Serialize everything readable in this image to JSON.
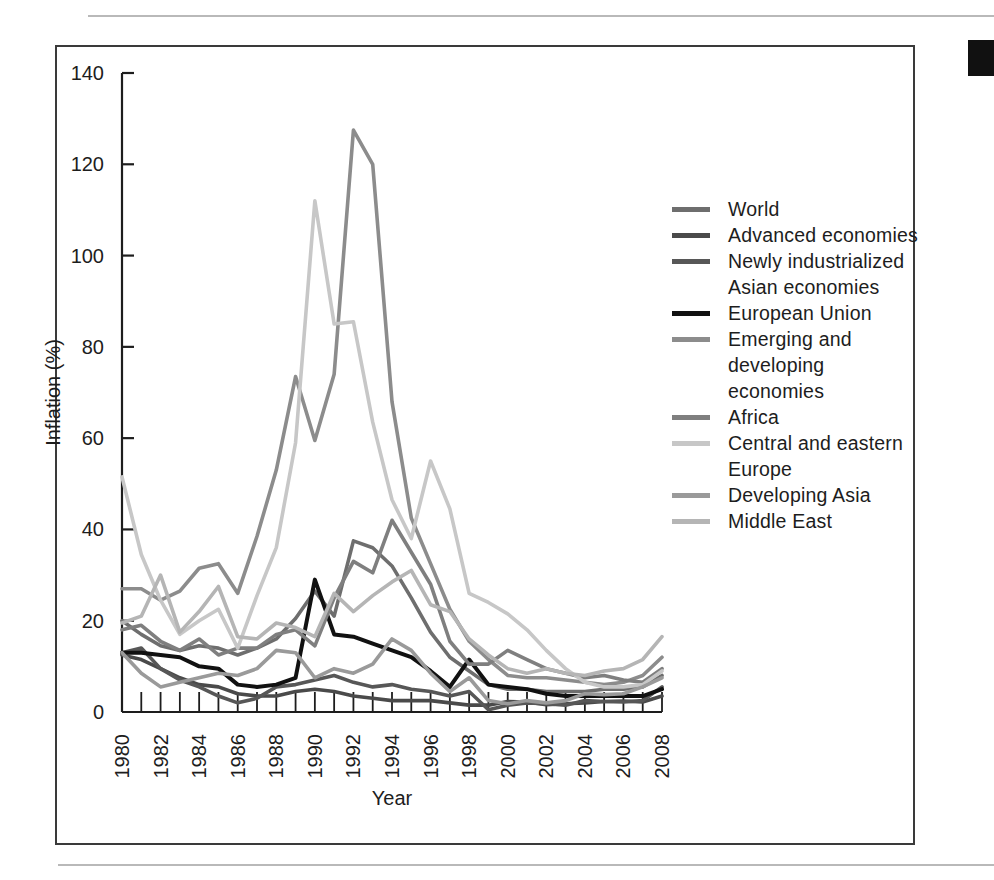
{
  "figure": {
    "frame_color": "#3a3a3a",
    "background": "#ffffff",
    "edge_mark_color": "#111111"
  },
  "chart_data": {
    "type": "line",
    "title": "",
    "xlabel": "Year",
    "ylabel": "Inflation (%)",
    "xlim": [
      1980,
      2008
    ],
    "ylim": [
      0,
      140
    ],
    "ytick_values": [
      0,
      20,
      40,
      60,
      80,
      100,
      120,
      140
    ],
    "xtick_values": [
      1980,
      1982,
      1984,
      1986,
      1988,
      1990,
      1992,
      1994,
      1996,
      1998,
      2000,
      2002,
      2004,
      2006,
      2008
    ],
    "xtick_labels": [
      "1980",
      "1982",
      "1984",
      "1986",
      "1988",
      "1990",
      "1992",
      "1994",
      "1996",
      "1998",
      "2000",
      "2002",
      "2004",
      "2006",
      "2008"
    ],
    "minor_xticks_every": 1,
    "grid": false,
    "legend_position": "right",
    "x": [
      1980,
      1981,
      1982,
      1983,
      1984,
      1985,
      1986,
      1987,
      1988,
      1989,
      1990,
      1991,
      1992,
      1993,
      1994,
      1995,
      1996,
      1997,
      1998,
      1999,
      2000,
      2001,
      2002,
      2003,
      2004,
      2005,
      2006,
      2007,
      2008
    ],
    "series": [
      {
        "name": "World",
        "color": "#6e6e6e",
        "width": 3.6,
        "values": [
          20.0,
          17.0,
          14.5,
          13.5,
          14.5,
          14.0,
          12.5,
          14.0,
          16.0,
          20.5,
          26.5,
          21.0,
          37.5,
          36.0,
          32.0,
          25.0,
          17.5,
          12.0,
          9.0,
          6.0,
          5.0,
          5.0,
          4.5,
          4.5,
          4.5,
          5.0,
          5.0,
          5.5,
          8.0
        ]
      },
      {
        "name": "Advanced economies",
        "color": "#4a4a4a",
        "width": 3.6,
        "values": [
          12.5,
          11.5,
          9.5,
          7.5,
          6.0,
          5.5,
          4.0,
          3.5,
          3.5,
          4.5,
          5.0,
          4.5,
          3.5,
          3.0,
          2.5,
          2.5,
          2.5,
          2.0,
          1.5,
          1.5,
          2.3,
          2.2,
          1.6,
          1.8,
          2.0,
          2.3,
          2.4,
          2.2,
          3.5
        ]
      },
      {
        "name": "Newly industrialized\nAsian economies",
        "color": "#575757",
        "width": 3.6,
        "values": [
          13.0,
          14.0,
          9.5,
          7.0,
          5.5,
          3.5,
          2.0,
          3.0,
          5.5,
          6.0,
          7.0,
          8.0,
          6.5,
          5.5,
          6.0,
          5.0,
          4.5,
          3.5,
          4.5,
          0.5,
          1.5,
          2.0,
          1.8,
          1.5,
          2.5,
          2.3,
          2.2,
          2.5,
          5.5
        ]
      },
      {
        "name": "European Union",
        "color": "#111111",
        "width": 4.0,
        "values": [
          13.0,
          13.0,
          12.5,
          12.0,
          10.0,
          9.5,
          6.0,
          5.5,
          6.0,
          7.5,
          29.0,
          17.0,
          16.5,
          15.0,
          13.5,
          12.0,
          9.0,
          5.5,
          11.5,
          6.0,
          5.5,
          5.0,
          4.0,
          3.5,
          3.5,
          3.5,
          3.5,
          3.5,
          5.0
        ]
      },
      {
        "name": "Emerging and\ndeveloping economies",
        "color": "#8c8c8c",
        "width": 3.6,
        "values": [
          27.0,
          27.0,
          24.5,
          26.5,
          31.5,
          32.5,
          26.0,
          38.5,
          53.0,
          73.5,
          59.5,
          74.0,
          127.5,
          120.0,
          68.0,
          42.5,
          32.5,
          22.5,
          15.5,
          11.5,
          8.0,
          7.5,
          7.5,
          7.0,
          6.5,
          6.0,
          6.5,
          8.0,
          12.0
        ]
      },
      {
        "name": "Africa",
        "color": "#7f7f7f",
        "width": 3.6,
        "values": [
          18.0,
          19.0,
          15.5,
          13.5,
          16.0,
          12.5,
          14.0,
          14.0,
          17.0,
          18.0,
          14.5,
          25.0,
          33.0,
          30.5,
          42.0,
          35.0,
          28.0,
          15.5,
          10.5,
          10.5,
          13.5,
          11.5,
          9.5,
          8.5,
          7.5,
          8.0,
          7.0,
          6.5,
          9.5
        ]
      },
      {
        "name": "Central and eastern\nEurope",
        "color": "#c7c7c7",
        "width": 3.6,
        "values": [
          51.5,
          34.5,
          24.5,
          17.0,
          20.0,
          22.5,
          14.0,
          25.5,
          36.0,
          59.0,
          112.0,
          85.0,
          85.5,
          63.5,
          46.5,
          38.0,
          55.0,
          44.5,
          26.0,
          24.0,
          21.5,
          18.0,
          13.5,
          9.5,
          6.5,
          5.5,
          5.5,
          6.0,
          9.0
        ]
      },
      {
        "name": "Developing Asia",
        "color": "#9a9a9a",
        "width": 3.6,
        "values": [
          13.0,
          8.5,
          5.5,
          6.5,
          7.5,
          8.5,
          8.0,
          9.5,
          13.5,
          13.0,
          7.5,
          9.5,
          8.5,
          10.5,
          16.0,
          13.5,
          8.5,
          4.5,
          7.5,
          2.5,
          1.8,
          2.5,
          2.0,
          2.5,
          4.0,
          3.8,
          4.0,
          5.5,
          7.5
        ]
      },
      {
        "name": "Middle East",
        "color": "#b5b5b5",
        "width": 3.6,
        "values": [
          19.5,
          21.0,
          30.0,
          17.5,
          22.0,
          27.5,
          16.5,
          16.0,
          19.5,
          18.5,
          16.5,
          26.0,
          22.0,
          25.5,
          28.5,
          31.0,
          23.5,
          22.0,
          16.0,
          12.5,
          9.5,
          8.5,
          9.5,
          8.5,
          8.0,
          9.0,
          9.5,
          11.5,
          16.5
        ]
      }
    ]
  }
}
